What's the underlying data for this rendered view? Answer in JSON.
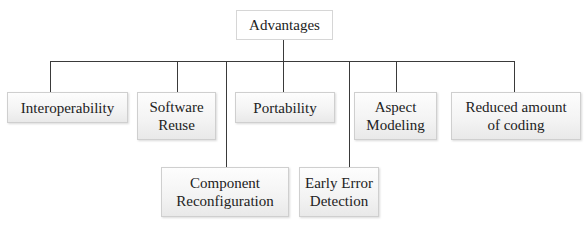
{
  "diagram": {
    "type": "tree",
    "root": {
      "label": "Advantages"
    },
    "children": [
      {
        "label": "Interoperability",
        "row": "top"
      },
      {
        "label": "Software\nReuse",
        "row": "top"
      },
      {
        "label": "Component\nReconfiguration",
        "row": "bottom"
      },
      {
        "label": "Portability",
        "row": "top"
      },
      {
        "label": "Early Error\nDetection",
        "row": "bottom"
      },
      {
        "label": "Aspect\nModeling",
        "row": "top"
      },
      {
        "label": "Reduced amount\nof coding",
        "row": "top"
      }
    ],
    "colors": {
      "line": "#3a3a3a",
      "node_border": "#cfcfcf",
      "node_fill_top": "#fdfdfd",
      "node_fill_bottom": "#e9e9e9",
      "text": "#222222"
    }
  }
}
